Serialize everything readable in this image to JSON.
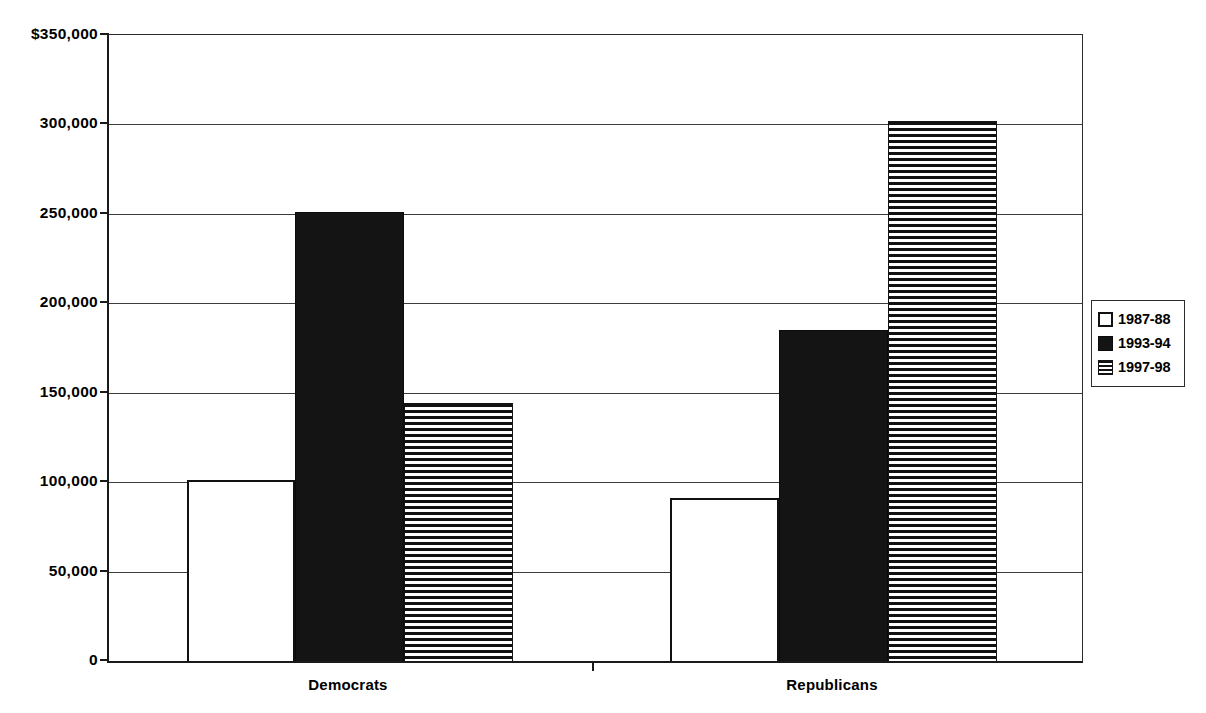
{
  "chart_data": {
    "type": "bar",
    "title": "",
    "xlabel": "",
    "ylabel": "",
    "categories": [
      "Democrats",
      "Republicans"
    ],
    "series": [
      {
        "name": "1987-88",
        "style": "open",
        "values": [
          101000,
          91000
        ]
      },
      {
        "name": "1993-94",
        "style": "solid",
        "values": [
          251000,
          185000
        ]
      },
      {
        "name": "1997-98",
        "style": "hstripe",
        "values": [
          144000,
          302000
        ]
      }
    ],
    "ylim": [
      0,
      350000
    ],
    "ytick_values": [
      0,
      50000,
      100000,
      150000,
      200000,
      250000,
      300000,
      350000
    ],
    "ytick_labels": [
      "0",
      "50,000",
      "100,000",
      "150,000",
      "200,000",
      "250,000",
      "300,000",
      "$350,000"
    ],
    "grid": true,
    "gridlines": "horizontal",
    "legend_position": "right",
    "legend_entries": [
      "1987-88",
      "1993-94",
      "1997-98"
    ],
    "colors": {
      "ink": "#111111",
      "grid": "#3c3c3c",
      "background": "#ffffff"
    }
  },
  "axis": {
    "y_labels": {
      "t350": "$350,000",
      "t300": "300,000",
      "t250": "250,000",
      "t200": "200,000",
      "t150": "150,000",
      "t100": "100,000",
      "t50": "50,000",
      "t0": "0"
    },
    "x_labels": {
      "democrats": "Democrats",
      "republicans": "Republicans"
    }
  },
  "legend": {
    "items": [
      {
        "label": "1987-88",
        "swatch": "open-square-icon"
      },
      {
        "label": "1993-94",
        "swatch": "filled-square-icon"
      },
      {
        "label": "1997-98",
        "swatch": "striped-square-icon"
      }
    ]
  }
}
